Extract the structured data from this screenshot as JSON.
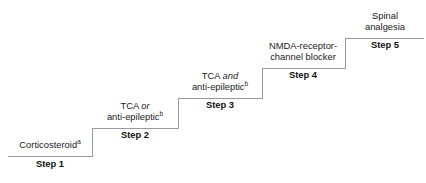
{
  "diagram": {
    "type": "staircase",
    "title": "",
    "line_color": "#9a9a9a",
    "text_color": "#222222",
    "label_color": "#111111",
    "background": "#ffffff",
    "steps": [
      {
        "id": "step-1",
        "label": "Step 1",
        "drug_lines": [
          {
            "text": "Corticosteroid",
            "italic_word": "",
            "superscript": "a"
          }
        ]
      },
      {
        "id": "step-2",
        "label": "Step 2",
        "drug_lines": [
          {
            "text": "TCA ",
            "italic_word": "or",
            "superscript": ""
          },
          {
            "text": "anti-epileptic",
            "italic_word": "",
            "superscript": "b"
          }
        ]
      },
      {
        "id": "step-3",
        "label": "Step 3",
        "drug_lines": [
          {
            "text": "TCA ",
            "italic_word": "and",
            "superscript": ""
          },
          {
            "text": "anti-epileptic",
            "italic_word": "",
            "superscript": "b"
          }
        ]
      },
      {
        "id": "step-4",
        "label": "Step 4",
        "drug_lines": [
          {
            "text": "NMDA-receptor-",
            "italic_word": "",
            "superscript": ""
          },
          {
            "text": "channel blocker",
            "italic_word": "",
            "superscript": ""
          }
        ]
      },
      {
        "id": "step-5",
        "label": "Step 5",
        "drug_lines": [
          {
            "text": "Spinal",
            "italic_word": "",
            "superscript": ""
          },
          {
            "text": "analgesia",
            "italic_word": "",
            "superscript": ""
          }
        ]
      }
    ],
    "path": "M 8 156 L 92 156 L 92 128 L 178 128 L 178 98 L 262 98 L 262 68 L 345 68 L 345 38 L 424 38"
  }
}
